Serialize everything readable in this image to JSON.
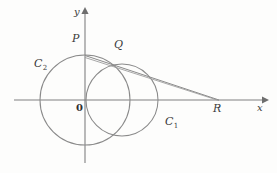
{
  "figure": {
    "background_color": "#fdfdfc",
    "stroke_color": "#808080",
    "label_color": "#3a3a3a",
    "width": 277,
    "height": 173
  },
  "axes": {
    "origin_label": "0",
    "x_label": "x",
    "y_label": "y",
    "x_axis_name": "horizontal-axis",
    "y_axis_name": "vertical-axis",
    "origin_px": {
      "x": 85,
      "y": 100
    },
    "x_axis_span_px": {
      "x1": 14,
      "x2": 266,
      "y": 100
    },
    "y_axis_span_px": {
      "y1": 10,
      "y2": 163,
      "x": 85
    }
  },
  "circles": [
    {
      "name": "C1",
      "label": "C",
      "subscript": "1",
      "center_px": {
        "x": 122,
        "y": 100
      },
      "radius_px": 36,
      "label_px": {
        "x": 165,
        "y": 117
      }
    },
    {
      "name": "C2",
      "label": "C",
      "subscript": "2",
      "center_px": {
        "x": 85,
        "y": 100
      },
      "radius_px": 45,
      "label_px": {
        "x": 34,
        "y": 59
      }
    }
  ],
  "points": [
    {
      "name": "P",
      "label": "P",
      "px": {
        "x": 85,
        "y": 55
      },
      "label_px": {
        "x": 72,
        "y": 35
      }
    },
    {
      "name": "Q",
      "label": "Q",
      "px": {
        "x": 112,
        "y": 62
      },
      "label_px": {
        "x": 114,
        "y": 41
      }
    },
    {
      "name": "R",
      "label": "R",
      "px": {
        "x": 219,
        "y": 100
      },
      "label_px": {
        "x": 213,
        "y": 104
      }
    }
  ],
  "segments": [
    {
      "name": "tangent-line-P-to-R",
      "from": "P",
      "to": "R"
    },
    {
      "name": "chord-line-P-to-R-upper",
      "from": "P",
      "to": "R"
    }
  ],
  "axis_labels_px": {
    "x_label_px": {
      "x": 258,
      "y": 104
    },
    "y_label_px": {
      "x": 74,
      "y": 8
    },
    "origin_label_px": {
      "x": 76,
      "y": 104
    }
  }
}
